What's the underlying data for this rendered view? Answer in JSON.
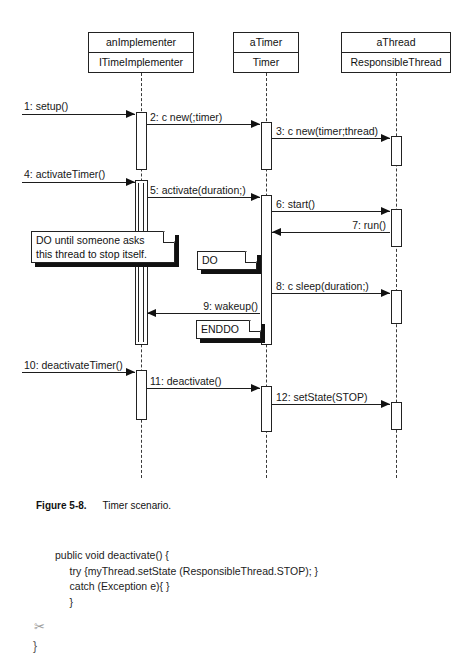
{
  "figure": {
    "label": "Figure 5-8.",
    "caption": "Timer scenario."
  },
  "diagram": {
    "type": "uml-sequence-diagram",
    "lifelines": [
      {
        "instance": "anImplementer",
        "class": "ITimeImplementer",
        "x": 141,
        "box": {
          "left": 88,
          "top": 32,
          "width": 106,
          "height": 41
        }
      },
      {
        "instance": "aTimer",
        "class": "Timer",
        "x": 266,
        "box": {
          "left": 233,
          "top": 32,
          "width": 66,
          "height": 41
        }
      },
      {
        "instance": "aThread",
        "class": "ResponsibleThread",
        "x": 396,
        "box": {
          "left": 341,
          "top": 32,
          "width": 110,
          "height": 41
        }
      }
    ],
    "messages": [
      {
        "seq": "1",
        "label": "1: setup()",
        "from": "actor",
        "to": "anImplementer",
        "y": 114,
        "dir": "right"
      },
      {
        "seq": "2",
        "label": "2: c new(;timer)",
        "from": "anImplementer",
        "to": "aTimer",
        "y": 124,
        "dir": "right"
      },
      {
        "seq": "3",
        "label": "3: c new(timer;thread)",
        "from": "aTimer",
        "to": "aThread",
        "y": 138,
        "dir": "right"
      },
      {
        "seq": "4",
        "label": "4: activateTimer()",
        "from": "actor",
        "to": "anImplementer",
        "y": 182,
        "dir": "right"
      },
      {
        "seq": "5",
        "label": "5: activate(duration;)",
        "from": "anImplementer",
        "to": "aTimer",
        "y": 197,
        "dir": "right"
      },
      {
        "seq": "6",
        "label": "6: start()",
        "from": "aTimer",
        "to": "aThread",
        "y": 211,
        "dir": "right"
      },
      {
        "seq": "7",
        "label": "7: run()",
        "from": "aThread",
        "to": "aTimer",
        "y": 232,
        "dir": "left"
      },
      {
        "seq": "8",
        "label": "8: c sleep(duration;)",
        "from": "aTimer",
        "to": "aThread",
        "y": 293,
        "dir": "right"
      },
      {
        "seq": "9",
        "label": "9: wakeup()",
        "from": "aTimer",
        "to": "anImplementer",
        "y": 313,
        "dir": "left"
      },
      {
        "seq": "10",
        "label": "10: deactivateTimer()",
        "from": "actor",
        "to": "anImplementer",
        "y": 372,
        "dir": "right"
      },
      {
        "seq": "11",
        "label": "11: deactivate()",
        "from": "anImplementer",
        "to": "aTimer",
        "y": 388,
        "dir": "right"
      },
      {
        "seq": "12",
        "label": "12: setState(STOP)",
        "from": "aTimer",
        "to": "aThread",
        "y": 404,
        "dir": "right"
      }
    ],
    "notes": [
      {
        "id": "loop-note",
        "text": "DO until someone asks\nthis thread to stop itself.",
        "left": 31,
        "top": 231,
        "width": 144,
        "height": 32
      },
      {
        "id": "do-marker",
        "text": "DO",
        "left": 197,
        "top": 251,
        "width": 60,
        "height": 19
      },
      {
        "id": "enddo-marker",
        "text": "ENDDO",
        "left": 196,
        "top": 320,
        "width": 65,
        "height": 19
      }
    ]
  },
  "code": {
    "language": "java",
    "lines": [
      "public void deactivate() {",
      "     try {myThread.setState (ResponsibleThread.STOP); }",
      "     catch (Exception e){ }",
      "     }"
    ],
    "trailing_brace": "}",
    "cut_mark": "✂"
  }
}
